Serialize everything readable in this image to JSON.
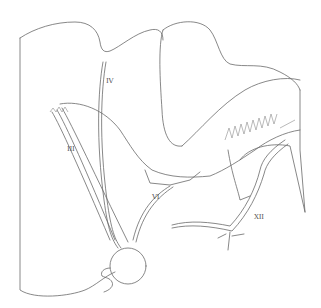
{
  "figure": {
    "type": "anatomical line drawing",
    "stroke_color": "#6a6a6a",
    "background": "#ffffff",
    "labels": [
      {
        "id": "IV",
        "text": "IV",
        "x": 106,
        "y": 78
      },
      {
        "id": "III",
        "text": "III",
        "x": 67,
        "y": 146
      },
      {
        "id": "VI",
        "text": "VI",
        "x": 152,
        "y": 194
      },
      {
        "id": "XII",
        "text": "XII",
        "x": 254,
        "y": 214
      }
    ]
  }
}
